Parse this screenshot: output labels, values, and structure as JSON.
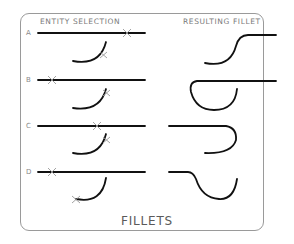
{
  "headers": {
    "left": "ENTITY SELECTION",
    "right": "RESULTING FILLET"
  },
  "rows": [
    {
      "label": "A"
    },
    {
      "label": "B"
    },
    {
      "label": "C"
    },
    {
      "label": "D"
    }
  ],
  "title": "FILLETS",
  "colors": {
    "line": "#111111",
    "pick_mark": "#9a9a9a",
    "frame": "#9a9a9a",
    "text": "#7a7a7a"
  }
}
